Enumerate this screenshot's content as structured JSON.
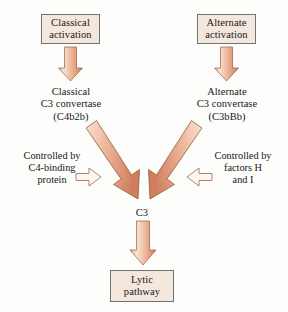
{
  "diagram": {
    "background_color": "#fdfdfb",
    "box_fill_color": "#f4e7dd",
    "box_border_color": "#6f7374",
    "arrow_light_color": "#f6d9c6",
    "arrow_dark_color": "#d4805f",
    "arrow_outline_color": "#8a5038",
    "text_color": "#17171a"
  },
  "nodes": {
    "classical_activation": {
      "lines": [
        "Classical",
        "activation"
      ],
      "line1": "Classical",
      "line2": "activation"
    },
    "alternate_activation": {
      "lines": [
        "Alternate",
        "activation"
      ],
      "line1": "Alternate",
      "line2": "activation"
    },
    "classical_convertase": {
      "line1": "Classical",
      "line2": "C3 convertase",
      "line3": "(C4b2b)"
    },
    "alternate_convertase": {
      "line1": "Alternate",
      "line2": "C3 convertase",
      "line3": "(C3bBb)"
    },
    "c3": {
      "label": "C3"
    },
    "lytic_pathway": {
      "line1": "Lytic",
      "line2": "pathway"
    }
  },
  "annotations": {
    "left_control": {
      "line1": "Controlled by",
      "line2": "C4-binding",
      "line3": "protein"
    },
    "right_control": {
      "line1": "Controlled by",
      "line2": "factors H",
      "line3": "and I"
    }
  },
  "edges": [
    {
      "name": "classical-activation-to-convertase",
      "from": "classical_activation",
      "to": "classical_convertase",
      "style": "vertical-down-arrow"
    },
    {
      "name": "alternate-activation-to-convertase",
      "from": "alternate_activation",
      "to": "alternate_convertase",
      "style": "vertical-down-arrow"
    },
    {
      "name": "classical-convertase-to-c3",
      "from": "classical_convertase",
      "to": "c3",
      "style": "diagonal-arrow"
    },
    {
      "name": "alternate-convertase-to-c3",
      "from": "alternate_convertase",
      "to": "c3",
      "style": "diagonal-arrow"
    },
    {
      "name": "c3-to-lytic-pathway",
      "from": "c3",
      "to": "lytic_pathway",
      "style": "vertical-down-arrow"
    },
    {
      "name": "left-control-pointer",
      "from": "left_control",
      "to": "classical-convertase-to-c3",
      "style": "hollow-arrow-right"
    },
    {
      "name": "right-control-pointer",
      "from": "right_control",
      "to": "alternate-convertase-to-c3",
      "style": "hollow-arrow-left"
    }
  ]
}
